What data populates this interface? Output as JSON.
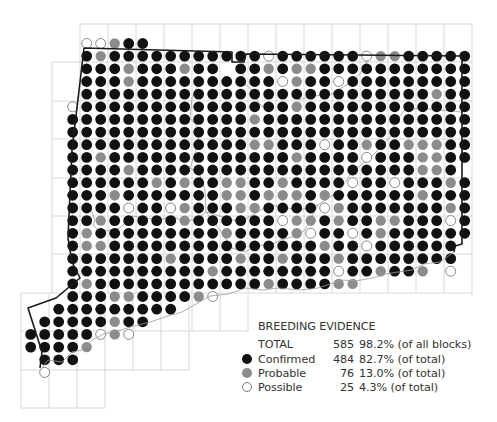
{
  "map": {
    "grid_origin": {
      "x0": 72.7,
      "dx": 14.0,
      "y0": 43.5,
      "dy": 12.65,
      "col_offset": -3
    },
    "row_legend": "Each string covers columns -3..28; B=Confirmed, G=Probable, O=Possible, .=no record",
    "rows": [
      "....OOGBB.......................",
      "....BGBBBBBBBBBBBOBBBBBBOGGBBBBB",
      "....BBBGBBBGBB.BBGBGGBBBBBBBBBBB",
      "....BBBGBBBBBBBBBBOGBBOBBBBBBBBB",
      "....BBBBBBBBBBBBBBBBBBBBBBBBBGBB",
      "...OBBBBBBBBBBBBBBBGBBBBBBBBBBBB",
      "...BBBBBBBBBBBBBGBBBBBBBBBBBBBBB",
      "...BBBBBBBBBBBBBBBBBBBBBBBBBBBBB",
      "...BBBBBBBBBBBBBGGBBBOBBGBBGGGBB",
      "...BBGBBBBBBBBBBBBBGBBBBOBBBGGBB",
      "...BBBBGBBBBBBBBBBBBBBBBBBBBGGB",
      "...BBBBBBGBGBBGGBBGBBBBOBBOBBBGB",
      "...BBBGBBBBBBBGGBGGGBGBBBBBBGBBB",
      "...BBBBOBBOGBBBGGBBBBOGBBBBBBBGB",
      "...BBGBBBBBGBBBBBBOGGBGBBGGBBBOB",
      "...BGBBBBBBBBBGBBBBGOBBOBGBBBBBB",
      "...BGGBBBBBBBBBBBBBBBGBBOBBBBBB.",
      "...BBBBBBBGBBBBGBBGBBBGBBBBBBBB.",
      "...BBBBBBBBBBGBBBBBBBBOBBGBBG.O.",
      "...BGBBBBBBBBBBBBGBBBBGG........",
      "...BBBGGBBBBGO..................",
      "..BBBBBBBBB.....................",
      ".BBBBBGBB.......................",
      "BBBBBOGO........................",
      "BBBBG...........................",
      ".BBB............................",
      ".O.............................."
    ],
    "colors": {
      "confirmed": "#111111",
      "probable": "#8c8c8c",
      "possible_fill": "#ffffff",
      "possible_stroke": "#7a7a7a",
      "grid": "#d4d4d4",
      "county_line": "#9a9a9a",
      "state_border": "#1a1a1a"
    }
  },
  "legend": {
    "title": "BREEDING EVIDENCE",
    "total": {
      "label": "TOTAL",
      "count": "585",
      "percent": "98.2% (of all blocks)"
    },
    "items": [
      {
        "symbol": "filled-black-dot",
        "label": "Confirmed",
        "count": "484",
        "percent": "82.7% (of total)"
      },
      {
        "symbol": "filled-gray-dot",
        "label": "Probable",
        "count": "76",
        "percent": "13.0% (of total)"
      },
      {
        "symbol": "open-circle",
        "label": "Possible",
        "count": "25",
        "percent": "4.3% (of total)"
      }
    ]
  }
}
